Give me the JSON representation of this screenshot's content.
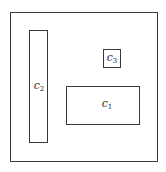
{
  "diagram": {
    "outer": {
      "x": 10,
      "y": 12,
      "w": 148,
      "h": 150
    },
    "regions": [
      {
        "id": "c1",
        "base": "c",
        "sub": "1",
        "x": 66,
        "y": 86,
        "w": 74,
        "h": 39
      },
      {
        "id": "c2",
        "base": "c",
        "sub": "2",
        "x": 29,
        "y": 30,
        "w": 19,
        "h": 113
      },
      {
        "id": "c3",
        "base": "c",
        "sub": "3",
        "x": 103,
        "y": 49,
        "w": 18,
        "h": 19
      }
    ]
  }
}
